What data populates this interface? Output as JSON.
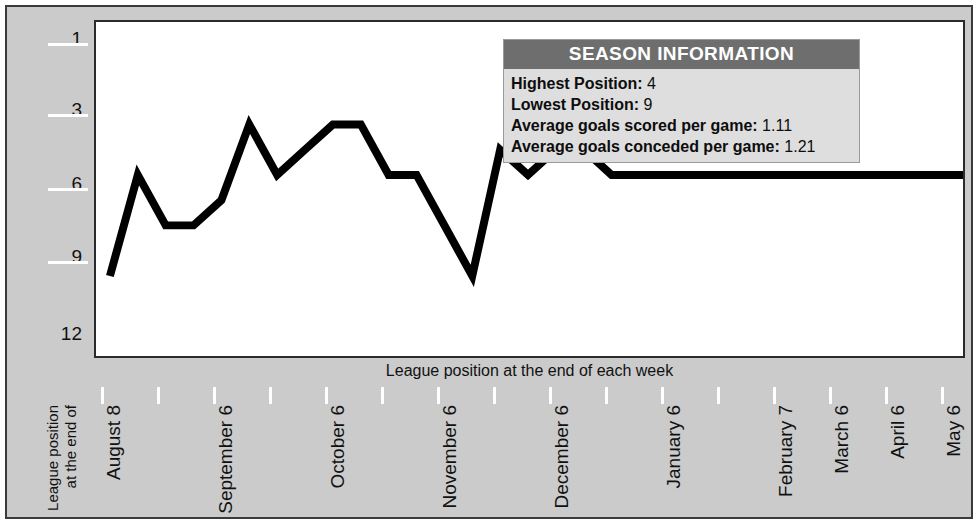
{
  "panel": {
    "background_color": "#cbcbcb",
    "plot_background_color": "#ffffff",
    "border_color": "#3a3a3a"
  },
  "info_box": {
    "title": "SEASON INFORMATION",
    "header_color": "#6e6e6e",
    "body_color": "#dedede",
    "rows": [
      {
        "key": "Highest Position:",
        "value": "4"
      },
      {
        "key": "Lowest Position:",
        "value": "9"
      },
      {
        "key": "Average goals scored per game:",
        "value": "1.11"
      },
      {
        "key": "Average goals conceded per game:",
        "value": "1.21"
      }
    ]
  },
  "chart_data": {
    "type": "line",
    "title": "",
    "xlabel": "League position at the end of each week",
    "ylabel": "League position at the end of",
    "ylabel_lines": [
      "League position",
      "at the end of"
    ],
    "grid": false,
    "legend_position": "top-right",
    "line_color": "#000000",
    "line_width": 7,
    "invert_yaxis": true,
    "ylim": [
      1,
      12
    ],
    "yticks": [
      1,
      3,
      6,
      9,
      12
    ],
    "ytick_labels": [
      "1",
      "3",
      "6",
      "9",
      "12"
    ],
    "xtick_labels": [
      "August 8",
      "September 6",
      "October 6",
      "November 6",
      "December 6",
      "January 6",
      "February 7",
      "March 6",
      "April 6",
      "May 6"
    ],
    "xtick_label_positions": [
      0,
      2,
      4,
      6,
      8,
      10,
      12,
      14,
      16,
      18
    ],
    "xtick_count": 16,
    "x": [
      0,
      1,
      2,
      3,
      4,
      5,
      6,
      7,
      8,
      9,
      10,
      11,
      12,
      13,
      14,
      15,
      16,
      17,
      18,
      19,
      20,
      21,
      22,
      23,
      24,
      25,
      26,
      27,
      28,
      29,
      30,
      31,
      32,
      33,
      34,
      35,
      36,
      37,
      38
    ],
    "values": [
      10,
      6,
      8,
      8,
      7,
      4,
      6,
      5,
      4,
      4,
      6,
      6,
      8,
      10,
      5,
      6,
      5,
      5,
      6,
      6,
      6,
      6,
      6,
      6,
      6,
      6,
      6,
      6,
      6,
      6,
      6,
      6,
      7,
      7,
      6,
      6,
      6,
      6,
      6
    ],
    "series": [
      {
        "name": "League position",
        "values": [
          10,
          6,
          8,
          8,
          7,
          4,
          6,
          5,
          4,
          4,
          6,
          6,
          8,
          10,
          5,
          6,
          5,
          5,
          6,
          6,
          6,
          6,
          6,
          6,
          6,
          6,
          6,
          6,
          6,
          6,
          6,
          6,
          7,
          7,
          6,
          6,
          6,
          6,
          6
        ]
      }
    ],
    "highest_position": 4,
    "lowest_position": 9
  }
}
